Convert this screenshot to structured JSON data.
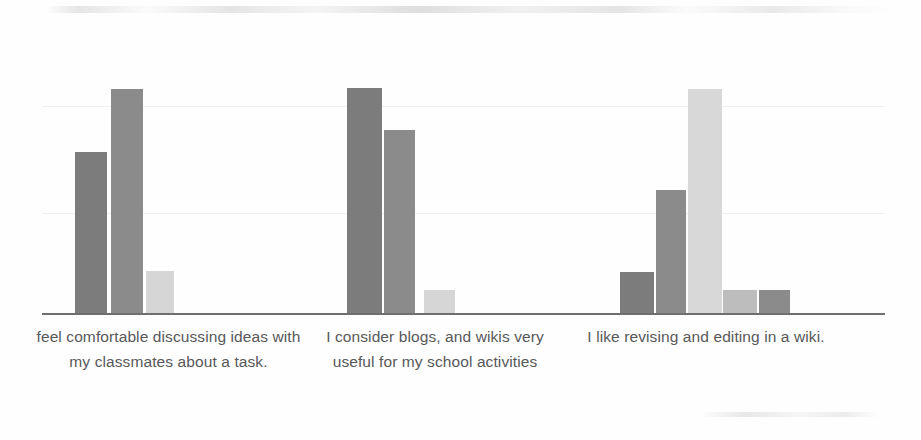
{
  "chart_data": {
    "type": "bar",
    "title": "",
    "subtitle": "",
    "xlabel": "",
    "ylabel": "",
    "ylim": [
      0,
      100
    ],
    "grid": true,
    "gridlines": [
      38,
      70
    ],
    "legend": "none",
    "axis_color": "#6f6f6f",
    "background": "#fefefe",
    "categories": [
      "feel comfortable discussing ideas with my classmates about a task.",
      "I consider blogs, and wikis very useful for my school activities",
      "I like revising and editing in a wiki."
    ],
    "groups": [
      {
        "label": "feel comfortable discussing ideas with my classmates about a task.",
        "bars": [
          {
            "value": 72,
            "color": "#7c7c7c",
            "shade": "dark-gray"
          },
          {
            "value": 100,
            "color": "#8b8b8b",
            "shade": "medium-gray"
          },
          {
            "value": 18,
            "color": "#d6d6d6",
            "shade": "light-gray"
          }
        ]
      },
      {
        "label": "I consider blogs, and wikis very useful for my school activities",
        "bars": [
          {
            "value": 100,
            "color": "#7c7c7c",
            "shade": "dark-gray"
          },
          {
            "value": 81,
            "color": "#8b8b8b",
            "shade": "medium-gray"
          },
          {
            "value": 11,
            "color": "#d6d6d6",
            "shade": "light-gray"
          }
        ]
      },
      {
        "label": "I like revising and editing in a wiki.",
        "bars": [
          {
            "value": 19,
            "color": "#7c7c7c",
            "shade": "dark-gray"
          },
          {
            "value": 55,
            "color": "#8b8b8b",
            "shade": "medium-gray"
          },
          {
            "value": 100,
            "color": "#d8d8d8",
            "shade": "very-light-gray"
          },
          {
            "value": 11,
            "color": "#bdbdbd",
            "shade": "light-gray"
          },
          {
            "value": 11,
            "color": "#8b8b8b",
            "shade": "medium-gray"
          }
        ]
      }
    ]
  },
  "layout": {
    "axis": {
      "x": 42,
      "y": 313,
      "width": 843,
      "height": 2
    },
    "plot_bottom": 313,
    "plot_top": 88,
    "gridline_y": [
      106,
      213
    ],
    "bar_geometry": [
      {
        "left": 75,
        "width": 32,
        "top": 152
      },
      {
        "left": 111,
        "width": 32,
        "top": 89
      },
      {
        "left": 146,
        "width": 28,
        "top": 271
      },
      {
        "left": 347,
        "width": 35,
        "top": 88
      },
      {
        "left": 384,
        "width": 31,
        "top": 130
      },
      {
        "left": 424,
        "width": 31,
        "top": 290
      },
      {
        "left": 620,
        "width": 34,
        "top": 272
      },
      {
        "left": 656,
        "width": 30,
        "top": 190
      },
      {
        "left": 688,
        "width": 34,
        "top": 89
      },
      {
        "left": 723,
        "width": 34,
        "top": 290
      },
      {
        "left": 759,
        "width": 31,
        "top": 290
      }
    ]
  }
}
